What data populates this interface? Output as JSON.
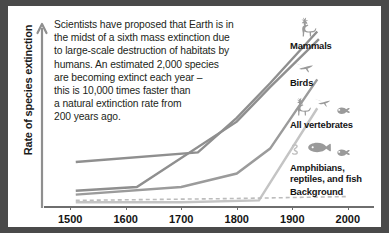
{
  "figure": {
    "background_color": "#ffffff",
    "frame_color": "#4a4a4a"
  },
  "blurb": {
    "lines": [
      "Scientists have proposed that Earth is in",
      "the midst of a sixth mass extinction due",
      "to large-scale destruction of habitats by",
      "humans. An estimated 2,000 species",
      "are becoming extinct each year –",
      "this is 10,000 times faster than",
      "a natural extinction rate from",
      "200 years ago."
    ]
  },
  "chart_data": {
    "type": "line",
    "title": "",
    "xlabel": "",
    "ylabel": "Rate of species extinction",
    "x_tick_labels": [
      "1500",
      "1600",
      "1700",
      "1800",
      "1900",
      "2000"
    ],
    "x": [
      1500,
      1600,
      1700,
      1800,
      1900,
      2000
    ],
    "xlim": [
      1460,
      2040
    ],
    "ylim": [
      0,
      100
    ],
    "grid": false,
    "legend_position": "right",
    "y_axis_arrow": true,
    "y_axis_tick_labels": [],
    "series": [
      {
        "name": "Mammals",
        "color": "#8f8f8f",
        "style": "solid",
        "width": 2.4,
        "x": [
          1510,
          1730,
          1800,
          1860,
          1945
        ],
        "values": [
          25,
          30,
          48,
          66,
          93
        ]
      },
      {
        "name": "Birds",
        "color": "#8f8f8f",
        "style": "solid",
        "width": 2.4,
        "x": [
          1510,
          1620,
          1800,
          1860,
          1948
        ],
        "values": [
          10,
          12,
          46,
          64,
          89
        ]
      },
      {
        "name": "All vertebrates",
        "color": "#9b9b9b",
        "style": "solid",
        "width": 2.4,
        "x": [
          1510,
          1700,
          1800,
          1860,
          1945
        ],
        "values": [
          8,
          12,
          19,
          32,
          68
        ]
      },
      {
        "name": "Amphibians, reptiles, and fish",
        "color": "#c4c4c4",
        "style": "solid",
        "width": 2.4,
        "x": [
          1510,
          1700,
          1840,
          1945
        ],
        "values": [
          4,
          4,
          5,
          53
        ]
      },
      {
        "name": "Background",
        "color": "#bcbcbc",
        "style": "dashed",
        "width": 1.6,
        "x": [
          1510,
          1800,
          2000
        ],
        "values": [
          5,
          6,
          7
        ]
      }
    ]
  },
  "legend": {
    "entries": [
      {
        "label": "Mammals",
        "icons": [
          "deer-icon"
        ]
      },
      {
        "label": "Birds",
        "icons": [
          "bird-icon"
        ]
      },
      {
        "label": "All vertebrates",
        "icons": [
          "deer-icon",
          "bird-icon",
          "frog-icon"
        ]
      },
      {
        "label_line1": "Amphibians,",
        "label_line2": "reptiles, and fish",
        "icons": [
          "snake-icon",
          "fish-icon",
          "frog-icon"
        ]
      },
      {
        "label": "Background",
        "icons": []
      }
    ]
  }
}
